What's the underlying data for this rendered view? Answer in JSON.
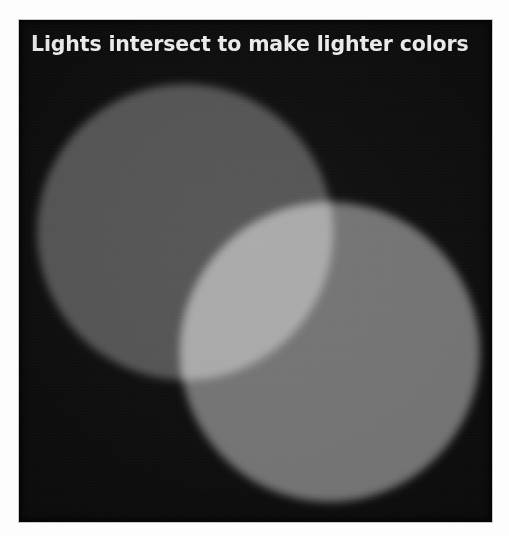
{
  "figure": {
    "title": "Lights intersect to make lighter colors",
    "panel_background_color": "#050505",
    "page_background_color": "#fdfdfd",
    "title_color": "#f2f2f2"
  },
  "diagram": {
    "type": "additive-color-venn",
    "shapes": [
      {
        "name": "upper-left-light-circle",
        "label": "Light source 1",
        "color": "#4d4d4d",
        "center_x": 185,
        "center_y": 232,
        "radius": 148
      },
      {
        "name": "lower-right-light-circle",
        "label": "Light source 2",
        "color": "#6f6f6f",
        "center_x": 330,
        "center_y": 352,
        "radius": 150
      }
    ],
    "intersection": {
      "name": "overlap-lens",
      "label": "Intersection",
      "color": "#b5b5b5",
      "blend_mode": "screen"
    }
  }
}
